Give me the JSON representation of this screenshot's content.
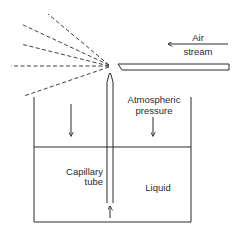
{
  "diagram": {
    "labels": {
      "air": "Air",
      "stream": "stream",
      "atmospheric": "Atmospheric",
      "pressure": "pressure",
      "capillary": "Capillary",
      "tube": "tube",
      "liquid": "Liquid"
    },
    "colors": {
      "line": "#2a2a2a",
      "background": "#ffffff"
    },
    "spray_lines": [
      {
        "x2": 48,
        "y2": 14
      },
      {
        "x2": 21,
        "y2": 24
      },
      {
        "x2": 21,
        "y2": 44
      },
      {
        "x2": 11,
        "y2": 66
      },
      {
        "x2": 24,
        "y2": 96
      }
    ]
  }
}
